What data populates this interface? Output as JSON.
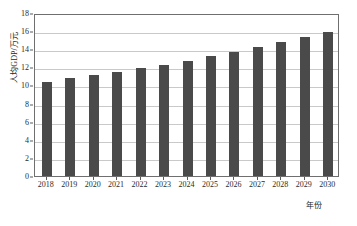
{
  "chart_data": {
    "type": "bar",
    "title": "",
    "subtitle": "",
    "xlabel": "年份",
    "ylabel": "人均GDP/万元",
    "categories": [
      "2018",
      "2019",
      "2020",
      "2021",
      "2022",
      "2023",
      "2024",
      "2025",
      "2026",
      "2027",
      "2028",
      "2029",
      "2030"
    ],
    "values": [
      10.4,
      10.8,
      11.1,
      11.5,
      11.95,
      12.3,
      12.7,
      13.2,
      13.65,
      14.2,
      14.75,
      15.3,
      15.9
    ],
    "series": [
      {
        "name": "人均GDP",
        "values": [
          10.4,
          10.8,
          11.1,
          11.5,
          11.95,
          12.3,
          12.7,
          13.2,
          13.65,
          14.2,
          14.75,
          15.3,
          15.9
        ]
      }
    ],
    "ylim": [
      0,
      18
    ],
    "yticks": [
      0,
      2,
      4,
      6,
      8,
      10,
      12,
      14,
      16,
      18
    ],
    "ytick_labels": [
      "0",
      "2",
      "4",
      "6",
      "8",
      "10",
      "12",
      "14",
      "16",
      "18"
    ],
    "grid": true,
    "grid_axis": "y",
    "legend": false,
    "legend_position": "none",
    "bar_color": "#4a4a4a",
    "grid_color": "#c9c9c9",
    "frame_color": "#6f6f6f",
    "background_color": "#ffffff",
    "annotations": []
  }
}
